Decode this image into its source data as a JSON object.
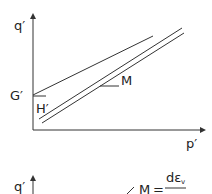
{
  "diagram": {
    "top_panel": {
      "y_axis_label": "q′",
      "x_axis_label": "p′",
      "intercept_label": "G′",
      "slope_label": "H′",
      "line_label": "M"
    },
    "bottom_panel": {
      "y_axis_label": "q′",
      "equation_lhs": "M",
      "equation_op": "=",
      "equation_numerator": "dε",
      "equation_numerator_sub": "v"
    }
  }
}
